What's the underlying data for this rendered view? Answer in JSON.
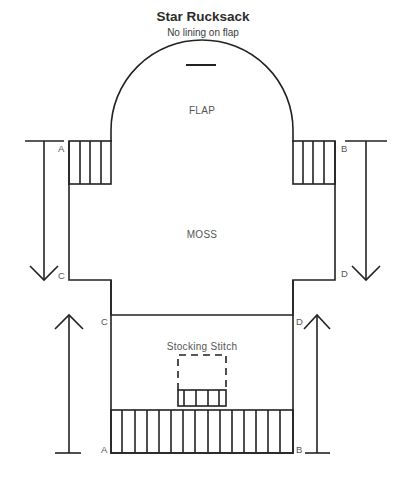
{
  "header": {
    "title": "Star Rucksack",
    "subtitle": "No lining on flap"
  },
  "sections": {
    "flap": "FLAP",
    "body": "MOSS",
    "lower": "Stocking Stitch"
  },
  "corner_labels": {
    "top_left": "A",
    "top_right": "B",
    "mid_left": "C",
    "mid_right": "D",
    "lower_left_top": "C",
    "lower_right_top": "D",
    "bottom_left": "A",
    "bottom_right": "B"
  },
  "annotations": {
    "flap_slot": "buttonhole-slot",
    "pocket": "dashed-pocket-outline",
    "arrows": [
      "down-left",
      "down-right",
      "up-left",
      "up-right"
    ]
  },
  "colors": {
    "line": "#222222",
    "text": "#555555"
  }
}
